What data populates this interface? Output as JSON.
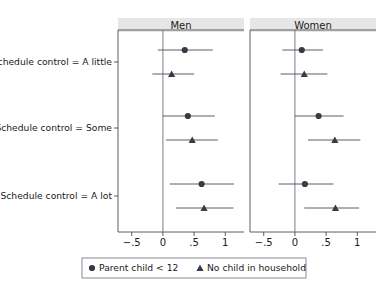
{
  "chart_data": {
    "type": "scatter",
    "title": "",
    "subtitle": "",
    "xlabel": "",
    "ylabel": "",
    "xlim": [
      -0.72,
      1.3
    ],
    "xticks": [
      -0.5,
      0,
      0.5,
      1
    ],
    "xticklabels": [
      "−.5",
      "0",
      ".5",
      "1"
    ],
    "grid": false,
    "zero_reference_line": 0,
    "legend_position": "bottom",
    "panels": [
      {
        "label": "Men",
        "rows": [
          {
            "category": "Schedule control = A little",
            "points": [
              {
                "series": "Parent child < 12",
                "marker": "circle",
                "estimate": 0.35,
                "ci_low": -0.08,
                "ci_high": 0.8
              },
              {
                "series": "No child in household",
                "marker": "triangle",
                "estimate": 0.14,
                "ci_low": -0.17,
                "ci_high": 0.5
              }
            ]
          },
          {
            "category": "Schedule control = Some",
            "points": [
              {
                "series": "Parent child < 12",
                "marker": "circle",
                "estimate": 0.4,
                "ci_low": 0.0,
                "ci_high": 0.83
              },
              {
                "series": "No child in household",
                "marker": "triangle",
                "estimate": 0.47,
                "ci_low": 0.05,
                "ci_high": 0.88
              }
            ]
          },
          {
            "category": "Schedule control = A lot",
            "points": [
              {
                "series": "Parent child < 12",
                "marker": "circle",
                "estimate": 0.62,
                "ci_low": 0.11,
                "ci_high": 1.14
              },
              {
                "series": "No child in household",
                "marker": "triangle",
                "estimate": 0.66,
                "ci_low": 0.21,
                "ci_high": 1.13
              }
            ]
          }
        ]
      },
      {
        "label": "Women",
        "rows": [
          {
            "category": "Schedule control = A little",
            "points": [
              {
                "series": "Parent child < 12",
                "marker": "circle",
                "estimate": 0.11,
                "ci_low": -0.2,
                "ci_high": 0.45
              },
              {
                "series": "No child in household",
                "marker": "triangle",
                "estimate": 0.15,
                "ci_low": -0.23,
                "ci_high": 0.52
              }
            ]
          },
          {
            "category": "Schedule control = Some",
            "points": [
              {
                "series": "Parent child < 12",
                "marker": "circle",
                "estimate": 0.38,
                "ci_low": 0.0,
                "ci_high": 0.78
              },
              {
                "series": "No child in household",
                "marker": "triangle",
                "estimate": 0.64,
                "ci_low": 0.21,
                "ci_high": 1.05
              }
            ]
          },
          {
            "category": "Schedule control = A lot",
            "points": [
              {
                "series": "Parent child < 12",
                "marker": "circle",
                "estimate": 0.16,
                "ci_low": -0.26,
                "ci_high": 0.62
              },
              {
                "series": "No child in household",
                "marker": "triangle",
                "estimate": 0.65,
                "ci_low": 0.15,
                "ci_high": 1.03
              }
            ]
          }
        ]
      }
    ],
    "ycategories": [
      "Schedule control = A little",
      "Schedule control = Some",
      "Schedule control = A lot"
    ],
    "legend": [
      {
        "marker": "circle",
        "label": "Parent child < 12"
      },
      {
        "marker": "triangle",
        "label": "No child in household"
      }
    ]
  },
  "colors": {
    "marker": "#3a3a44",
    "ci_line": "#4a4a55",
    "zero_line": "#6b6b7a",
    "panel_header_bg": "#e6e6e6",
    "background": "#ffffff",
    "text": "#1a1a1a"
  }
}
